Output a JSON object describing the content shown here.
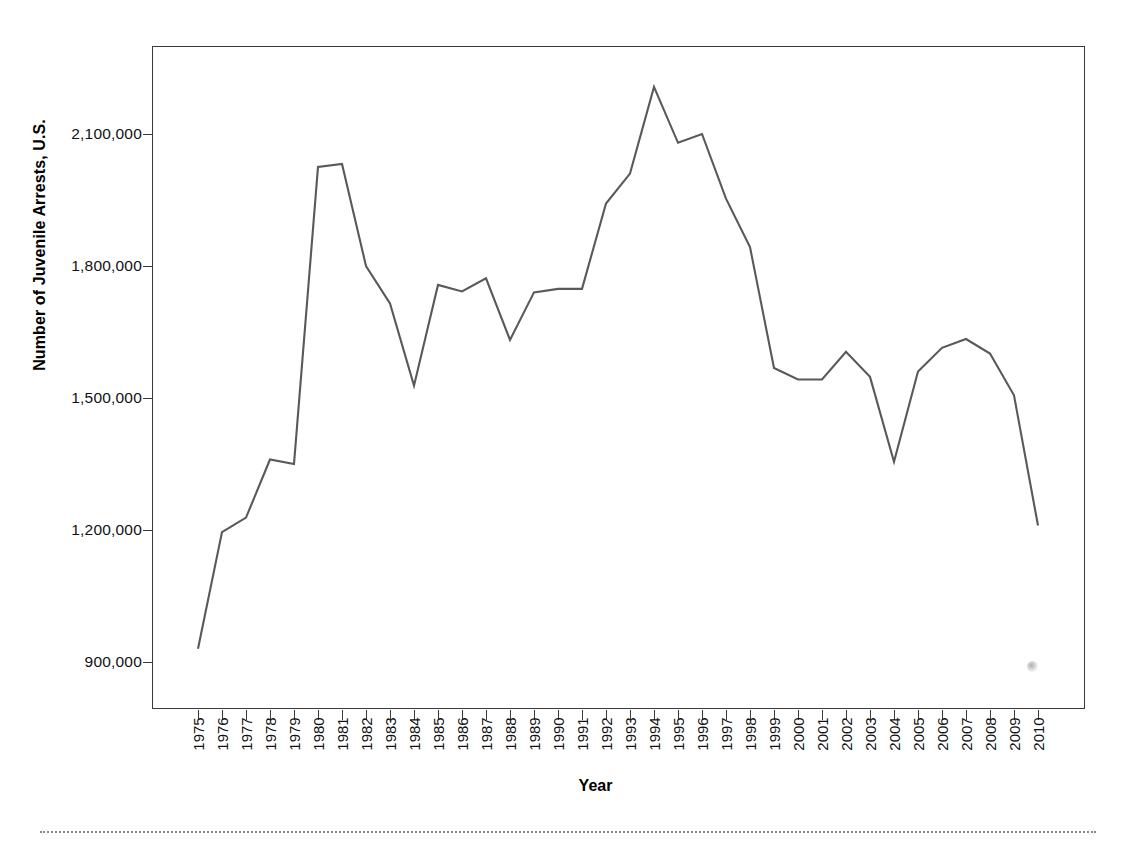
{
  "chart_data": {
    "type": "line",
    "title": "",
    "xlabel": "Year",
    "ylabel": "Number of Juvenile Arrests, U.S.",
    "x": [
      1975,
      1976,
      1977,
      1978,
      1979,
      1980,
      1981,
      1982,
      1983,
      1984,
      1985,
      1986,
      1987,
      1988,
      1989,
      1990,
      1991,
      1992,
      1993,
      1994,
      1995,
      1996,
      1997,
      1998,
      1999,
      2000,
      2001,
      2002,
      2003,
      2004,
      2005,
      2006,
      2007,
      2008,
      2009,
      2010
    ],
    "values": [
      930000,
      1195000,
      1228000,
      1360000,
      1350000,
      2025000,
      2032000,
      1800000,
      1715000,
      1528000,
      1757000,
      1742000,
      1772000,
      1632000,
      1740000,
      1748000,
      1748000,
      1942000,
      2010000,
      2207000,
      2080000,
      2100000,
      1953000,
      1843000,
      1568000,
      1542000,
      1542000,
      1605000,
      1548000,
      1355000,
      1560000,
      1614000,
      1634000,
      1601000,
      1506000,
      1210000
    ],
    "x_tick_labels": [
      "1975",
      "1976",
      "1977",
      "1978",
      "1979",
      "1980",
      "1981",
      "1982",
      "1983",
      "1984",
      "1985",
      "1986",
      "1987",
      "1988",
      "1989",
      "1990",
      "1991",
      "1992",
      "1993",
      "1994",
      "1995",
      "1996",
      "1997",
      "1998",
      "1999",
      "2000",
      "2001",
      "2002",
      "2003",
      "2004",
      "2005",
      "2006",
      "2007",
      "2008",
      "2009",
      "2010"
    ],
    "y_tick_values": [
      900000,
      1200000,
      1500000,
      1800000,
      2100000
    ],
    "y_tick_labels": [
      "900,000",
      "1,200,000",
      "1,500,000",
      "1,800,000",
      "2,100,000"
    ],
    "ylim": [
      793000,
      2300000
    ],
    "xlim": [
      1974.1,
      2011.9
    ],
    "grid": false,
    "legend": false,
    "line_color": "#595959",
    "axis_color": "#3a3a3a",
    "background_color": "#ffffff",
    "series": [
      {
        "name": "Number of Juvenile Arrests, U.S.",
        "values": [
          930000,
          1195000,
          1228000,
          1360000,
          1350000,
          2025000,
          2032000,
          1800000,
          1715000,
          1528000,
          1757000,
          1742000,
          1772000,
          1632000,
          1740000,
          1748000,
          1748000,
          1942000,
          2010000,
          2207000,
          2080000,
          2100000,
          1953000,
          1843000,
          1568000,
          1542000,
          1542000,
          1605000,
          1548000,
          1355000,
          1560000,
          1614000,
          1634000,
          1601000,
          1506000,
          1210000
        ]
      }
    ]
  },
  "axes": {
    "y_title": "Number of Juvenile Arrests, U.S.",
    "x_title": "Year"
  },
  "artifacts": {
    "smudge_label": "scan-smudge",
    "rule_label": "page-divider"
  }
}
